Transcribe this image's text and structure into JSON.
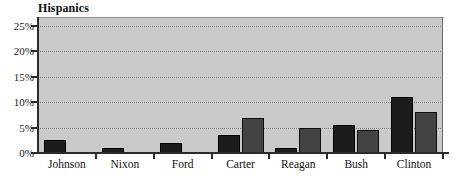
{
  "chart_data": {
    "type": "bar",
    "title": "Hispanics",
    "xlabel": "",
    "ylabel": "",
    "ylim": [
      0,
      26.5
    ],
    "grid": true,
    "legend": "none",
    "ytick_labels": [
      "0%",
      "5%",
      "10%",
      "15%",
      "20%",
      "25%"
    ],
    "ytick_values": [
      0,
      5,
      10,
      15,
      20,
      25
    ],
    "categories": [
      "Johnson",
      "Nixon",
      "Ford",
      "Carter",
      "Reagan",
      "Bush",
      "Clinton"
    ],
    "series": [
      {
        "name": "series-dark",
        "color": "#1c1c1c",
        "values": [
          2.5,
          1.0,
          2.0,
          3.5,
          1.0,
          5.5,
          11.0
        ]
      },
      {
        "name": "series-gray",
        "color": "#434343",
        "values": [
          0,
          0,
          0,
          6.8,
          5.0,
          4.5,
          8.0
        ]
      }
    ],
    "plot_background": "#c9c9c9",
    "axis_color": "#2b2b2b",
    "gridline_color": "#7d7d7d"
  }
}
